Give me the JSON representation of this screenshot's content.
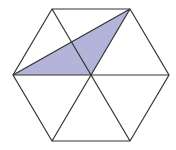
{
  "diagram": {
    "type": "geometry",
    "shape": "regular-hexagon",
    "colors": {
      "background": "#ffffff",
      "stroke": "#333333",
      "shade": "#b4b4da"
    },
    "vertices": {
      "top_left": [
        52,
        9
      ],
      "top_right": [
        130,
        9
      ],
      "right": [
        169,
        75
      ],
      "bottom_right": [
        130,
        141
      ],
      "bottom_left": [
        52,
        141
      ],
      "left": [
        13,
        75
      ],
      "center": [
        91,
        75
      ]
    },
    "shaded_triangle": [
      "left",
      "center",
      "top_right"
    ],
    "labels": []
  }
}
